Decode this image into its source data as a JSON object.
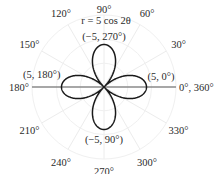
{
  "chart_data": {
    "type": "line",
    "coordinate_system": "polar",
    "title": "",
    "equation": "r = 5 cos 2θ",
    "series": [
      {
        "name": "r = 5 cos 2θ",
        "a": 5,
        "k": 2,
        "function": "cos",
        "theta_range_deg": [
          0,
          360
        ],
        "color": "#1a1a1a"
      }
    ],
    "r_range": [
      0,
      5
    ],
    "angular_ticks_deg": [
      0,
      30,
      60,
      90,
      120,
      150,
      180,
      210,
      240,
      270,
      300,
      330
    ],
    "angular_tick_labels": [
      "0°, 360°",
      "30°",
      "60°",
      "90°",
      "120°",
      "150°",
      "180°",
      "210°",
      "240°",
      "270°",
      "300°",
      "330°"
    ],
    "annotations": [
      {
        "text": "(5, 0°)",
        "r": 5,
        "theta_deg": 0
      },
      {
        "text": "(5, 180°)",
        "r": 5,
        "theta_deg": 180
      },
      {
        "text": "(−5, 270°)",
        "r": -5,
        "theta_deg": 270
      },
      {
        "text": "(−5, 90°)",
        "r": -5,
        "theta_deg": 90
      }
    ],
    "grid": true,
    "polar_axis_highlighted": true
  }
}
